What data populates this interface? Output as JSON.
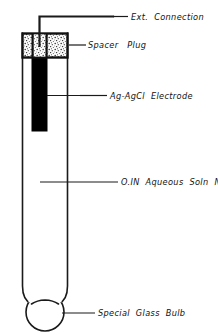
{
  "figure": {
    "background_color": "#ffffff",
    "line_color": "#1a1a1a",
    "fill_electrode_color": "#000000",
    "plug_fill_color": "#f2f2f2",
    "glass_fill_color": "#ffffff"
  },
  "labels": {
    "ext_connection": "Ext.  Connection",
    "spacer_plug": "Spacer   Plug",
    "electrode": "Ag-AgCl  Electrode",
    "solution": "O.IN  Aqueous  Soln  NaCl",
    "glass_bulb": "Special  Glass  Bulb"
  },
  "parts": {
    "wire": "external-connection-wire",
    "plug": "spacer-plug",
    "electrode": "ag-agcl-electrode",
    "tube": "glass-tube",
    "solution": "aqueous-nacl-solution",
    "bulb": "special-glass-bulb"
  }
}
